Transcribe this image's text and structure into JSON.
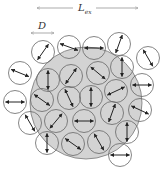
{
  "labels": {
    "length_label": "L",
    "length_subscript": "ex",
    "diameter_label": "D"
  },
  "colors": {
    "disk_fill": "#d3d3d3",
    "stroke": "#666666",
    "arrow": "#222222"
  },
  "disk": {
    "cx": 86,
    "cy": 103,
    "r": 56
  },
  "particle_radius": 11.5,
  "particles": [
    {
      "x": 43,
      "y": 52,
      "angle": -55
    },
    {
      "x": 69,
      "y": 47,
      "angle": 20
    },
    {
      "x": 94,
      "y": 48,
      "angle": 0
    },
    {
      "x": 119,
      "y": 44,
      "angle": -70
    },
    {
      "x": 148,
      "y": 58,
      "angle": 60
    },
    {
      "x": 20,
      "y": 73,
      "angle": 22
    },
    {
      "x": 48,
      "y": 80,
      "angle": 90
    },
    {
      "x": 71,
      "y": 76,
      "angle": -55
    },
    {
      "x": 98,
      "y": 73,
      "angle": 40
    },
    {
      "x": 122,
      "y": 67,
      "angle": 90
    },
    {
      "x": 142,
      "y": 85,
      "angle": 0
    },
    {
      "x": 15,
      "y": 102,
      "angle": 0
    },
    {
      "x": 42,
      "y": 100,
      "angle": 35
    },
    {
      "x": 69,
      "y": 98,
      "angle": 65
    },
    {
      "x": 91,
      "y": 97,
      "angle": 90
    },
    {
      "x": 116,
      "y": 91,
      "angle": -25
    },
    {
      "x": 140,
      "y": 110,
      "angle": 25
    },
    {
      "x": 30,
      "y": 123,
      "angle": 60
    },
    {
      "x": 56,
      "y": 121,
      "angle": -50
    },
    {
      "x": 84,
      "y": 121,
      "angle": 0
    },
    {
      "x": 112,
      "y": 113,
      "angle": -70
    },
    {
      "x": 127,
      "y": 132,
      "angle": 90
    },
    {
      "x": 47,
      "y": 143,
      "angle": 90
    },
    {
      "x": 73,
      "y": 144,
      "angle": 35
    },
    {
      "x": 99,
      "y": 142,
      "angle": 60
    },
    {
      "x": 120,
      "y": 155,
      "angle": 0
    }
  ]
}
